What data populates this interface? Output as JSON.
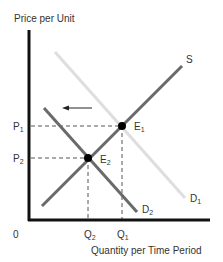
{
  "diagram": {
    "y_axis_label": "Price per Unit",
    "x_axis_label": "Quantity per Time Period",
    "origin_label": "0",
    "curves": {
      "supply": {
        "label": "S",
        "color": "#6a6a6a"
      },
      "demand_original": {
        "label": "D",
        "sub": "1",
        "color": "#dedede"
      },
      "demand_new": {
        "label": "D",
        "sub": "2",
        "color": "#6a6a6a"
      }
    },
    "equilibria": [
      {
        "label": "E",
        "sub": "1"
      },
      {
        "label": "E",
        "sub": "2"
      }
    ],
    "price_ticks": [
      {
        "label": "P",
        "sub": "1"
      },
      {
        "label": "P",
        "sub": "2"
      }
    ],
    "quantity_ticks": [
      {
        "label": "Q",
        "sub": "2"
      },
      {
        "label": "Q",
        "sub": "1"
      }
    ],
    "shift_arrow": {
      "direction": "left",
      "meaning": "demand decrease"
    }
  }
}
